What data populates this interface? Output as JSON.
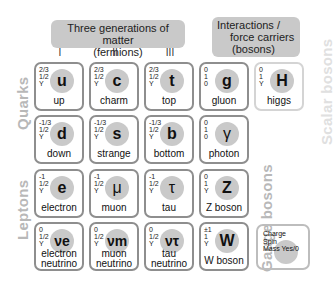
{
  "headers": {
    "fermions": "Three generations of matter\n(fermions)",
    "fermions_line1": "Three generations of matter",
    "fermions_line2": "(fermions)",
    "bosons_line1": "Interactions /",
    "bosons_line2": "force carriers",
    "bosons_line3": "(bosons)"
  },
  "generations": [
    "I",
    "II",
    "III"
  ],
  "side_labels": {
    "quarks": "Quarks",
    "leptons": "Leptons",
    "gauge_bosons": "Gauge bosons",
    "scalar_bosons": "Scalar bosons"
  },
  "colors": {
    "circle": "#c9c9c9",
    "border": "#8e8e8e",
    "label": "#b8b8b8",
    "header": "#c9c9c9"
  },
  "particles": [
    {
      "id": "up",
      "symbol": "u",
      "name": "up",
      "charge": "2/3",
      "spin": "1/2",
      "mass": "Y"
    },
    {
      "id": "charm",
      "symbol": "c",
      "name": "charm",
      "charge": "2/3",
      "spin": "1/2",
      "mass": "Y"
    },
    {
      "id": "top",
      "symbol": "t",
      "name": "top",
      "charge": "2/3",
      "spin": "1/2",
      "mass": "Y"
    },
    {
      "id": "gluon",
      "symbol": "g",
      "name": "gluon",
      "charge": "0",
      "spin": "1",
      "mass": "0"
    },
    {
      "id": "higgs",
      "symbol": "H",
      "name": "higgs",
      "charge": "0",
      "spin": "1",
      "mass": "Y"
    },
    {
      "id": "down",
      "symbol": "d",
      "name": "down",
      "charge": "-1/3",
      "spin": "1/2",
      "mass": "Y"
    },
    {
      "id": "strange",
      "symbol": "s",
      "name": "strange",
      "charge": "-1/3",
      "spin": "1/2",
      "mass": "Y"
    },
    {
      "id": "bottom",
      "symbol": "b",
      "name": "bottom",
      "charge": "-1/3",
      "spin": "1/2",
      "mass": "Y"
    },
    {
      "id": "photon",
      "symbol": "γ",
      "name": "photon",
      "charge": "0",
      "spin": "1",
      "mass": "0"
    },
    {
      "id": "electron",
      "symbol": "e",
      "name": "electron",
      "charge": "-1",
      "spin": "1/2",
      "mass": "Y"
    },
    {
      "id": "muon",
      "symbol": "μ",
      "name": "muon",
      "charge": "-1",
      "spin": "1/2",
      "mass": "Y"
    },
    {
      "id": "tau",
      "symbol": "τ",
      "name": "tau",
      "charge": "-1",
      "spin": "1/2",
      "mass": "Y"
    },
    {
      "id": "z",
      "symbol": "Z",
      "name": "Z boson",
      "charge": "0",
      "spin": "1",
      "mass": "Y"
    },
    {
      "id": "nue",
      "symbol": "νe",
      "name": "electron neutrino",
      "name1": "electron",
      "name2": "neutrino",
      "charge": "0",
      "spin": "1/2",
      "mass": "Y"
    },
    {
      "id": "num",
      "symbol": "νm",
      "name": "muon neutrino",
      "name1": "muon",
      "name2": "neutrino",
      "charge": "0",
      "spin": "1/2",
      "mass": "Y"
    },
    {
      "id": "nut",
      "symbol": "ντ",
      "name": "tau neutrino",
      "name1": "tau",
      "name2": "neutrino",
      "charge": "0",
      "spin": "1/2",
      "mass": "Y"
    },
    {
      "id": "w",
      "symbol": "W",
      "name": "W boson",
      "charge": "±1",
      "spin": "1",
      "mass": "Y"
    }
  ],
  "legend": {
    "line1": "Charge",
    "line2": "Spin",
    "line3": "Mass Yes/0"
  }
}
